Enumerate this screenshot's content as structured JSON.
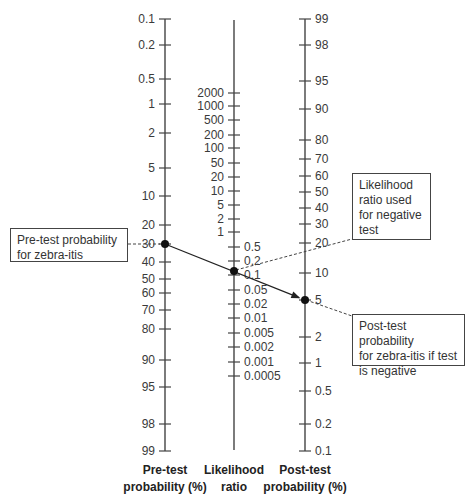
{
  "chart_data": {
    "type": "nomogram",
    "axes": [
      {
        "name": "pre_test",
        "title_lines": [
          "Pre-test",
          "probability (%)"
        ],
        "x": 165,
        "y_top": 19,
        "y_bottom": 451,
        "label_side": "left",
        "ticks": [
          {
            "label": "0.1",
            "y": 19
          },
          {
            "label": "0.2",
            "y": 45
          },
          {
            "label": "0.5",
            "y": 79
          },
          {
            "label": "1",
            "y": 104
          },
          {
            "label": "2",
            "y": 133
          },
          {
            "label": "5",
            "y": 168
          },
          {
            "label": "10",
            "y": 196
          },
          {
            "label": "20",
            "y": 225
          },
          {
            "label": "30",
            "y": 244
          },
          {
            "label": "40",
            "y": 262
          },
          {
            "label": "50",
            "y": 279
          },
          {
            "label": "60",
            "y": 293
          },
          {
            "label": "70",
            "y": 310
          },
          {
            "label": "80",
            "y": 329
          },
          {
            "label": "90",
            "y": 360
          },
          {
            "label": "95",
            "y": 387
          },
          {
            "label": "98",
            "y": 424
          },
          {
            "label": "99",
            "y": 451
          }
        ]
      },
      {
        "name": "likelihood_ratio",
        "title_lines": [
          "Likelihood",
          "ratio"
        ],
        "x": 234,
        "y_top": 20,
        "y_bottom": 450,
        "ticks_upper_side": "left",
        "ticks": [
          {
            "label": "2000",
            "y": 93,
            "side": "left"
          },
          {
            "label": "1000",
            "y": 106,
            "side": "left"
          },
          {
            "label": "500",
            "y": 120,
            "side": "left"
          },
          {
            "label": "200",
            "y": 135,
            "side": "left"
          },
          {
            "label": "100",
            "y": 148,
            "side": "left"
          },
          {
            "label": "50",
            "y": 163,
            "side": "left"
          },
          {
            "label": "20",
            "y": 177,
            "side": "left"
          },
          {
            "label": "10",
            "y": 191,
            "side": "left"
          },
          {
            "label": "5",
            "y": 205,
            "side": "left"
          },
          {
            "label": "2",
            "y": 219,
            "side": "left"
          },
          {
            "label": "1",
            "y": 232,
            "side": "left"
          },
          {
            "label": "0.5",
            "y": 247,
            "side": "right"
          },
          {
            "label": "0.2",
            "y": 261,
            "side": "right"
          },
          {
            "label": "0.1",
            "y": 275,
            "side": "right"
          },
          {
            "label": "0.05",
            "y": 290,
            "side": "right"
          },
          {
            "label": "0.02",
            "y": 304,
            "side": "right"
          },
          {
            "label": "0.01",
            "y": 318,
            "side": "right"
          },
          {
            "label": "0.005",
            "y": 333,
            "side": "right"
          },
          {
            "label": "0.002",
            "y": 347,
            "side": "right"
          },
          {
            "label": "0.001",
            "y": 362,
            "side": "right"
          },
          {
            "label": "0.0005",
            "y": 376,
            "side": "right"
          }
        ]
      },
      {
        "name": "post_test",
        "title_lines": [
          "Post-test",
          "probability (%)"
        ],
        "x": 305,
        "y_top": 19,
        "y_bottom": 451,
        "label_side": "right",
        "ticks": [
          {
            "label": "99",
            "y": 19
          },
          {
            "label": "98",
            "y": 45
          },
          {
            "label": "95",
            "y": 81
          },
          {
            "label": "90",
            "y": 109
          },
          {
            "label": "80",
            "y": 140
          },
          {
            "label": "70",
            "y": 159
          },
          {
            "label": "60",
            "y": 176
          },
          {
            "label": "50",
            "y": 192
          },
          {
            "label": "40",
            "y": 208
          },
          {
            "label": "30",
            "y": 224
          },
          {
            "label": "20",
            "y": 243
          },
          {
            "label": "10",
            "y": 273
          },
          {
            "label": "5",
            "y": 300
          },
          {
            "label": "2",
            "y": 337
          },
          {
            "label": "1",
            "y": 363
          },
          {
            "label": "0.5",
            "y": 391
          },
          {
            "label": "0.2",
            "y": 424
          },
          {
            "label": "0.1",
            "y": 451
          }
        ]
      }
    ],
    "example_line": {
      "pre_test_probability_pct": 30,
      "likelihood_ratio": 0.12,
      "post_test_probability_pct": 5,
      "points": [
        {
          "x": 165,
          "y": 244
        },
        {
          "x": 234,
          "y": 271
        },
        {
          "x": 305,
          "y": 300
        }
      ]
    },
    "annotations": [
      {
        "name": "pre-test-annotation",
        "lines": [
          "Pre-test probability",
          "for zebra-itis"
        ]
      },
      {
        "name": "lr-annotation",
        "lines": [
          "Likelihood",
          "ratio used",
          "for negative",
          "test"
        ]
      },
      {
        "name": "post-test-annotation",
        "lines": [
          "Post-test probability",
          "for zebra-itis if test",
          "is negative"
        ]
      }
    ]
  }
}
